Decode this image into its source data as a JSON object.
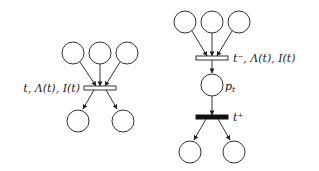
{
  "left_net": {
    "transition_label": "t, Λ(t), I(t)",
    "transition_style": "hollow",
    "input_places": 3,
    "output_places": 2
  },
  "right_net": {
    "transition_minus_label": "t⁻, Λ(t), I(t)",
    "transition_minus_style": "hollow",
    "intermediate_place_label": "p",
    "intermediate_place_subscript": "t",
    "transition_plus_label": "t⁺",
    "transition_plus_style": "filled",
    "input_places": 3,
    "output_places": 2
  },
  "colors": {
    "stroke": "#333333",
    "filled_transition": "#111111",
    "background": "#ffffff"
  }
}
